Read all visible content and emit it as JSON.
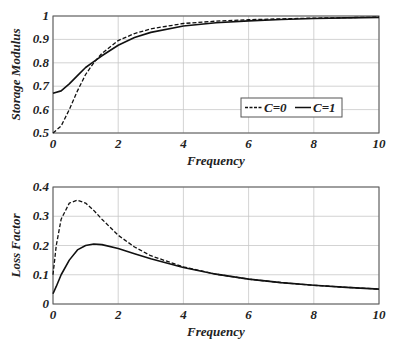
{
  "chart_data": [
    {
      "type": "line",
      "title": "",
      "xlabel": "Frequency",
      "ylabel": "Storage Modulus",
      "xlim": [
        0,
        10
      ],
      "ylim": [
        0.5,
        1
      ],
      "xticks": [
        "0",
        "2",
        "4",
        "6",
        "8",
        "10"
      ],
      "yticks": [
        "0.5",
        "0.6",
        "0.7",
        "0.8",
        "0.9",
        "1"
      ],
      "grid": true,
      "legend": {
        "position": "lower right",
        "entries": [
          "C=0",
          "C=1"
        ]
      },
      "x": [
        0,
        0.25,
        0.5,
        0.75,
        1,
        1.25,
        1.5,
        2,
        2.5,
        3,
        4,
        5,
        6,
        7,
        8,
        9,
        10
      ],
      "series": [
        {
          "name": "C=0",
          "style": "dashed",
          "values": [
            0.5,
            0.53,
            0.6,
            0.68,
            0.75,
            0.8,
            0.84,
            0.895,
            0.925,
            0.945,
            0.968,
            0.978,
            0.984,
            0.988,
            0.991,
            0.993,
            0.995
          ]
        },
        {
          "name": "C=1",
          "style": "solid",
          "values": [
            0.67,
            0.68,
            0.71,
            0.745,
            0.78,
            0.805,
            0.83,
            0.875,
            0.908,
            0.93,
            0.957,
            0.971,
            0.979,
            0.985,
            0.989,
            0.992,
            0.994
          ]
        }
      ]
    },
    {
      "type": "line",
      "title": "",
      "xlabel": "Frequency",
      "ylabel": "Loss Factor",
      "xlim": [
        0,
        10
      ],
      "ylim": [
        0,
        0.4
      ],
      "xticks": [
        "0",
        "2",
        "4",
        "6",
        "8",
        "10"
      ],
      "yticks": [
        "0",
        "0.1",
        "0.2",
        "0.3",
        "0.4"
      ],
      "grid": true,
      "x": [
        0,
        0.1,
        0.25,
        0.5,
        0.75,
        1,
        1.25,
        1.5,
        2,
        2.5,
        3,
        4,
        5,
        6,
        7,
        8,
        9,
        10
      ],
      "series": [
        {
          "name": "C=0",
          "style": "dashed",
          "values": [
            0.1,
            0.2,
            0.29,
            0.345,
            0.355,
            0.345,
            0.32,
            0.29,
            0.235,
            0.195,
            0.165,
            0.127,
            0.102,
            0.085,
            0.073,
            0.064,
            0.057,
            0.051
          ]
        },
        {
          "name": "C=1",
          "style": "solid",
          "values": [
            0.035,
            0.06,
            0.1,
            0.15,
            0.185,
            0.2,
            0.205,
            0.203,
            0.19,
            0.172,
            0.155,
            0.125,
            0.102,
            0.085,
            0.073,
            0.064,
            0.057,
            0.051
          ]
        }
      ]
    }
  ]
}
